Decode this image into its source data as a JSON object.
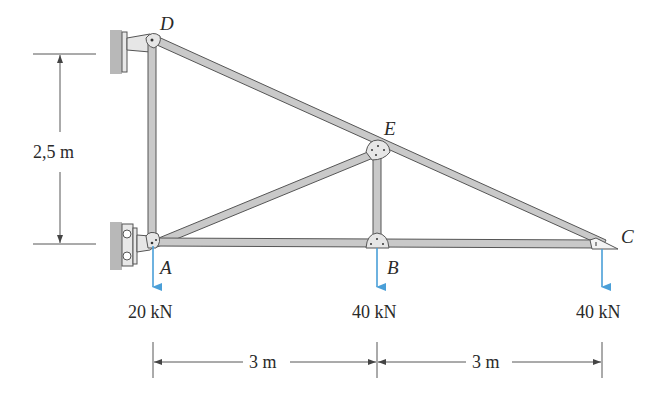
{
  "diagram": {
    "type": "truss",
    "joints": {
      "A": "A",
      "B": "B",
      "C": "C",
      "D": "D",
      "E": "E"
    },
    "loads": {
      "A": "20 kN",
      "B": "40 kN",
      "C": "40 kN"
    },
    "dimensions": {
      "height": "2,5 m",
      "span_AB": "3 m",
      "span_BC": "3 m"
    },
    "members": [
      "AD",
      "DE",
      "EC",
      "AE",
      "EB",
      "AB",
      "BC"
    ],
    "colors": {
      "member_fill": "#c9c9c9",
      "member_stroke": "#555555",
      "wall": "#b8b8b8",
      "load_arrow": "#4a9fd8",
      "dim_line": "#444444"
    }
  }
}
